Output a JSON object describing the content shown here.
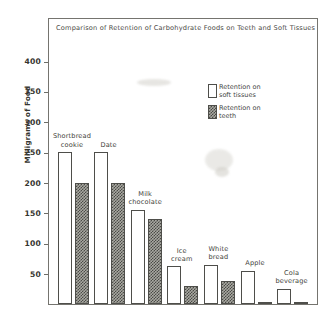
{
  "chart_data": {
    "type": "bar",
    "title": "Comparison of Retention of Carbohydrate  Foods on Teeth and Soft Tissues",
    "xlabel": "",
    "ylabel": "Milligrams of Food",
    "ylim": [
      0,
      430
    ],
    "ytick_labels": [
      "400",
      "350",
      "300",
      "250",
      "200",
      "150",
      "100",
      "50"
    ],
    "ytick_values": [
      400,
      350,
      300,
      250,
      200,
      150,
      100,
      50
    ],
    "grid": false,
    "legend_position": "upper right",
    "categories": [
      "Shortbread\ncookie",
      "Date",
      "Milk\nchocolate",
      "Ice\ncream",
      "White\nbread",
      "Apple",
      "Cola\nbeverage"
    ],
    "category_labels": [
      [
        "Shortbread",
        "cookie"
      ],
      [
        "Date"
      ],
      [
        "Milk",
        "chocolate"
      ],
      [
        "Ice",
        "cream"
      ],
      [
        "White",
        "bread"
      ],
      [
        "Apple"
      ],
      [
        "Cola",
        "beverage"
      ]
    ],
    "series": [
      {
        "name": "Retention on soft tissues",
        "legend_lines": [
          "Retention on",
          "soft tissues"
        ],
        "pattern": "open",
        "values": [
          250,
          250,
          155,
          62,
          65,
          55,
          25
        ]
      },
      {
        "name": "Retention on teeth",
        "legend_lines": [
          "Retention on",
          "teeth"
        ],
        "pattern": "crosshatch",
        "values": [
          200,
          200,
          140,
          30,
          38,
          4,
          4
        ]
      }
    ]
  },
  "colors": {
    "frame": "#75746f",
    "bar_outline": "#4e4e4a",
    "open_fill": "#ffffff",
    "hatch_fill": "#a9a9a2",
    "hatch_ink": "#4a4a46",
    "text": "#3a3a38",
    "background": "#ffffff"
  }
}
